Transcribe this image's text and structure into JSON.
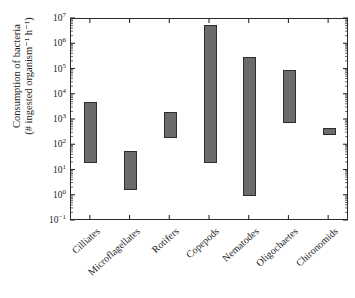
{
  "chart_data": {
    "type": "bar",
    "orientation": "vertical",
    "bar_style": "floating-range",
    "title": "",
    "subtitle": "",
    "xlabel": "",
    "ylabel_line1": "Consumption of bacteria",
    "ylabel_line2": "(# ingested organism⁻¹ h⁻¹)",
    "yscale": "log",
    "ylim": [
      0.1,
      10000000
    ],
    "ylim_exponents": [
      -1,
      7
    ],
    "grid": false,
    "legend": null,
    "ytick_labels": [
      "10⁷",
      "10⁶",
      "10⁵",
      "10⁴",
      "10³",
      "10²",
      "10¹",
      "10⁰",
      "10⁻¹"
    ],
    "ytick_values": [
      10000000,
      1000000,
      100000,
      10000,
      1000,
      100,
      10,
      1,
      0.1
    ],
    "ytick_mantissas": [
      "7",
      "6",
      "5",
      "4",
      "3",
      "2",
      "1",
      "0",
      "−1"
    ],
    "minor_ticks": true,
    "categories": [
      "Cilliates",
      "Microflagellates",
      "Rotifers",
      "Copepods",
      "Nematodes",
      "Oligochaetes",
      "Chironomids"
    ],
    "series": [
      {
        "name": "Consumption range",
        "low": [
          20,
          1.7,
          200,
          20,
          1.0,
          800,
          350
        ],
        "high": [
          5000,
          60,
          2000,
          6000000,
          300000,
          100000,
          500
        ]
      }
    ],
    "points": [
      {
        "category": "Cilliates",
        "low": 20,
        "high": 5000,
        "low_exp": 1.3,
        "high_exp": 3.7
      },
      {
        "category": "Microflagellates",
        "low": 1.7,
        "high": 60,
        "low_exp": 0.23,
        "high_exp": 1.78
      },
      {
        "category": "Rotifers",
        "low": 200,
        "high": 2000,
        "low_exp": 2.3,
        "high_exp": 3.3
      },
      {
        "category": "Copepods",
        "low": 20,
        "high": 6000000,
        "low_exp": 1.3,
        "high_exp": 6.78
      },
      {
        "category": "Nematodes",
        "low": 1.0,
        "high": 300000,
        "low_exp": 0.0,
        "high_exp": 5.48
      },
      {
        "category": "Oligochaetes",
        "low": 800,
        "high": 100000,
        "low_exp": 2.9,
        "high_exp": 5.0
      },
      {
        "category": "Chironomids",
        "low": 350,
        "high": 500,
        "low_exp": 2.54,
        "high_exp": 2.7
      }
    ],
    "colors": {
      "bar_fill": "#6b6b6b",
      "bar_edge": "#2e2e2e",
      "axis": "#2a2a2a",
      "text": "#1a1a1a",
      "background": "#ffffff"
    }
  }
}
